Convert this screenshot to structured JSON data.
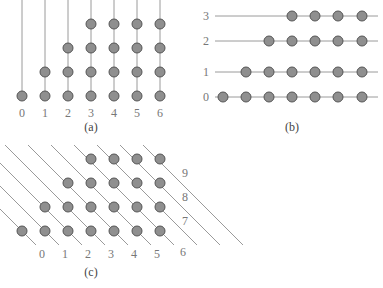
{
  "colors": {
    "line": "#9a9a9a",
    "dot_fill": "#8f8f8f",
    "dot_stroke": "#555555",
    "label": "#777777"
  },
  "panel_a": {
    "caption": "(a)",
    "column_labels": [
      "0",
      "1",
      "2",
      "3",
      "4",
      "5",
      "6"
    ],
    "dots_per_column": [
      1,
      2,
      3,
      4,
      4,
      4,
      4
    ]
  },
  "panel_b": {
    "caption": "(b)",
    "row_labels": [
      "0",
      "1",
      "2",
      "3"
    ],
    "dots_per_row_start_index": [
      0,
      1,
      2,
      3
    ],
    "columns": 7
  },
  "panel_c": {
    "caption": "(c)",
    "diagonal_labels_bottom": [
      "0",
      "1",
      "2",
      "3",
      "4",
      "5",
      "6"
    ],
    "diagonal_labels_right": [
      "7",
      "8",
      "9"
    ],
    "rows": [
      {
        "start_col": 0,
        "end_col": 6
      },
      {
        "start_col": 1,
        "end_col": 6
      },
      {
        "start_col": 2,
        "end_col": 6
      },
      {
        "start_col": 3,
        "end_col": 6
      }
    ]
  }
}
